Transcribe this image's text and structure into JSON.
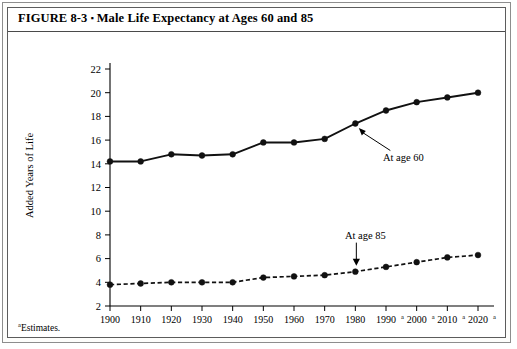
{
  "figure": {
    "title_prefix": "FIGURE 8-3",
    "title_separator": "▪",
    "title_text": "Male Life Expectancy at Ages 60 and 85",
    "footnote_marker": "a",
    "footnote_text": "Estimates."
  },
  "chart_data": {
    "type": "line",
    "title": "Male Life Expectancy at Ages 60 and 85",
    "xlabel": "",
    "ylabel": "Added Years of Life",
    "x": [
      1900,
      1910,
      1920,
      1930,
      1940,
      1950,
      1960,
      1970,
      1980,
      1990,
      2000,
      2010,
      2020
    ],
    "xtick_labels": [
      "1900",
      "1910",
      "1920",
      "1930",
      "1940",
      "1950",
      "1960",
      "1970",
      "1980",
      "1990",
      "2000",
      "2010",
      "2020"
    ],
    "xtick_superscripts": [
      "",
      "",
      "",
      "",
      "",
      "",
      "",
      "",
      "",
      "a",
      "a",
      "a",
      "a"
    ],
    "ytick_labels": [
      "2",
      "4",
      "6",
      "8",
      "10",
      "12",
      "14",
      "16",
      "18",
      "20",
      "22"
    ],
    "yticks": [
      2,
      4,
      6,
      8,
      10,
      12,
      14,
      16,
      18,
      20,
      22
    ],
    "ylim": [
      2,
      22
    ],
    "grid": false,
    "legend": "none",
    "series": [
      {
        "name": "At age 60",
        "style": "solid",
        "marker": "filled-circle",
        "color": "#111111",
        "values": [
          14.2,
          14.2,
          14.8,
          14.7,
          14.8,
          15.8,
          15.8,
          16.1,
          17.4,
          18.5,
          19.2,
          19.6,
          20.0
        ]
      },
      {
        "name": "At age 85",
        "style": "dashed",
        "marker": "filled-circle",
        "color": "#111111",
        "values": [
          3.8,
          3.9,
          4.0,
          4.0,
          4.0,
          4.4,
          4.5,
          4.6,
          4.9,
          5.3,
          5.7,
          6.1,
          6.3
        ]
      }
    ],
    "annotations": [
      {
        "text": "At age 60",
        "target_x": 1980,
        "target_y": 17.4
      },
      {
        "text": "At age 85",
        "target_x": 1980,
        "target_y": 4.9
      }
    ]
  }
}
